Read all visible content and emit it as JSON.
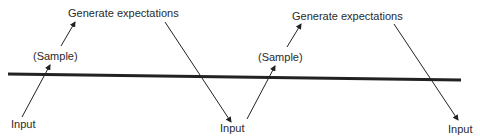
{
  "diagram": {
    "labels": {
      "gen1": "Generate expectations",
      "sample1": "(Sample)",
      "input1": "Input",
      "input2": "Input",
      "sample2": "(Sample)",
      "gen2": "Generate expectations",
      "input3": "Input"
    },
    "colors": {
      "line": "#222222",
      "text": "#2a2a2a",
      "background": "#ffffff"
    }
  }
}
